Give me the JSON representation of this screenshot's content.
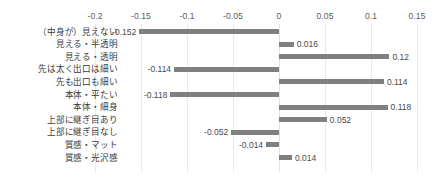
{
  "chart_data": {
    "type": "bar",
    "orientation": "horizontal",
    "title": "",
    "xlabel": "",
    "ylabel": "",
    "xlim": [
      -0.2,
      0.15
    ],
    "xticks": [
      "-0.2",
      "-0.15",
      "-0.1",
      "-0.05",
      "0",
      "0.05",
      "0.1",
      "0.15"
    ],
    "xtick_values": [
      -0.2,
      -0.15,
      -0.1,
      -0.05,
      0,
      0.05,
      0.1,
      0.15
    ],
    "grid": true,
    "grid_axis": "x",
    "legend": "none",
    "bar_color": "#808080",
    "categories": [
      "（中身が）見えない",
      "見える・半透明",
      "見える・透明",
      "先は太く出口は細い",
      "先も出口も細い",
      "本体・平たい",
      "本体・細身",
      "上部に継ぎ目あり",
      "上部に継ぎ目なし",
      "質感・マット",
      "質感・光沢感"
    ],
    "values": [
      -0.152,
      0.016,
      0.12,
      -0.114,
      0.114,
      -0.118,
      0.118,
      0.052,
      -0.052,
      -0.014,
      0.014
    ],
    "value_labels": [
      "-0.152",
      "0.016",
      "0.12",
      "-0.114",
      "0.114",
      "-0.118",
      "0.118",
      "0.052",
      "-0.052",
      "-0.014",
      "0.014"
    ]
  }
}
